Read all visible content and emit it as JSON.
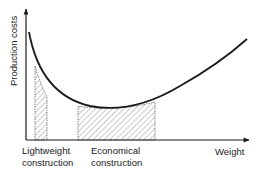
{
  "diagram": {
    "y_axis_label": "Production costs",
    "x_axis_label": "Weight",
    "regions": [
      {
        "id": "lightweight",
        "line1": "Lightweight",
        "line2": "construction"
      },
      {
        "id": "economical",
        "line1": "Economical",
        "line2": "construction"
      }
    ],
    "colors": {
      "ink": "#1a1a1a",
      "hatch": "#555555",
      "background": "#ffffff"
    }
  }
}
